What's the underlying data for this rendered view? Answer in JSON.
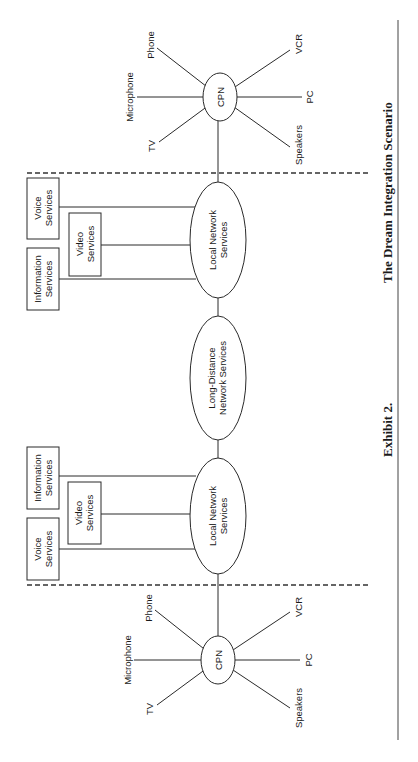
{
  "figure": {
    "caption_label": "Exhibit 2.",
    "caption_title": "The Dream Integration Scenario"
  },
  "top_premises": {
    "hub": "CPN",
    "devices": {
      "phone": "Phone",
      "microphone": "Microphone",
      "tv": "TV",
      "vcr": "VCR",
      "pc": "PC",
      "speakers": "Speakers"
    }
  },
  "top_local": {
    "network": [
      "Local Network",
      "Services"
    ],
    "voice": [
      "Voice",
      "Services"
    ],
    "video": [
      "Video",
      "Services"
    ],
    "information": [
      "Information",
      "Services"
    ]
  },
  "long_distance": {
    "network": [
      "Long-Distance",
      "Network Services"
    ]
  },
  "bottom_local": {
    "network": [
      "Local Network",
      "Services"
    ],
    "information": [
      "Information",
      "Services"
    ],
    "video": [
      "Video",
      "Services"
    ],
    "voice": [
      "Voice",
      "Services"
    ]
  },
  "bottom_premises": {
    "hub": "CPN",
    "devices": {
      "phone": "Phone",
      "microphone": "Microphone",
      "tv": "TV",
      "vcr": "VCR",
      "pc": "PC",
      "speakers": "Speakers"
    }
  }
}
